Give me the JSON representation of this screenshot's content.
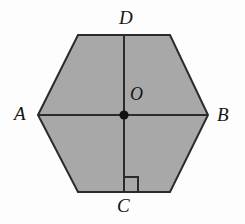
{
  "figure": {
    "kind": "regular-hexagon-with-diagonals",
    "background_color": "#fdfdfd",
    "fill_color": "#a8a8a8",
    "stroke_color": "#2b2b2b",
    "stroke_width": 2,
    "labels": {
      "A": "A",
      "B": "B",
      "C": "C",
      "D": "D",
      "O": "O"
    },
    "points": {
      "A": [
        38,
        115
      ],
      "B": [
        208,
        115
      ],
      "C": [
        124,
        192
      ],
      "D": [
        124,
        35
      ],
      "O": [
        124,
        115
      ],
      "top_left": [
        78,
        35
      ],
      "top_right": [
        170,
        35
      ],
      "bottom_left": [
        78,
        192
      ],
      "bottom_right": [
        170,
        192
      ]
    },
    "hexagon_points": "38,115 78,35 170,35 208,115 170,192 78,192",
    "segments": [
      {
        "name": "diagonal-AB",
        "from": "A",
        "to": "B"
      },
      {
        "name": "segment-DC",
        "from": "D",
        "to": "C"
      }
    ],
    "center_dot": {
      "name": "center-point-O",
      "cx": 124,
      "cy": 115,
      "r": 4.6,
      "color": "#111111"
    },
    "right_angle_marker": {
      "name": "right-angle-marker-at-C",
      "path": "M 124 177 L 138 177 L 138 192",
      "size": 15
    }
  }
}
